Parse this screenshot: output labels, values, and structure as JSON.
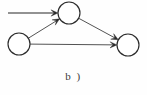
{
  "figure": {
    "caption": "b )",
    "background_color": "#fefefe",
    "node_stroke_color": "#2b2b2b",
    "node_fill_color": "#ffffff",
    "edge_color": "#4a4a4a",
    "entry_edge_color": "#6e6e6e",
    "arrowhead_color": "#2b2b2b"
  },
  "graph": {
    "type": "directed-graph",
    "node_count": 3,
    "edge_count": 3,
    "external_arrow_count": 1,
    "nodes": [
      {
        "id": "top",
        "label": "",
        "cx": 69,
        "cy": 13,
        "r": 11
      },
      {
        "id": "left",
        "label": "",
        "cx": 19,
        "cy": 44,
        "r": 11
      },
      {
        "id": "right",
        "label": "",
        "cx": 128,
        "cy": 45,
        "r": 11
      }
    ],
    "edges": [
      {
        "id": "left-to-top",
        "from": "left",
        "to": "top",
        "directed": true,
        "style": "straight"
      },
      {
        "id": "top-to-right",
        "from": "top",
        "to": "right",
        "directed": true,
        "style": "straight"
      },
      {
        "id": "left-to-right",
        "from": "left",
        "to": "right",
        "directed": true,
        "style": "straight"
      }
    ],
    "external_arrows": [
      {
        "id": "entry-arrow-top",
        "to": "top",
        "from_x": 8,
        "from_y": 13,
        "to_x": 58,
        "to_y": 13,
        "directed": true
      }
    ]
  }
}
